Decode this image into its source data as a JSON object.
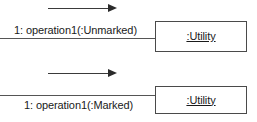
{
  "diagram": {
    "type": "uml-communication-diagram",
    "background_color": "#ffffff",
    "line_color": "#555555",
    "arrow_color": "#2b2b2b",
    "border_color": "#4a4a4a",
    "text_color": "#1a1a1a",
    "groups": [
      {
        "id": "unmarked",
        "message_label": "1: operation1(:Unmarked)",
        "object_label": ":Utility",
        "arrow_direction": "right",
        "arrow_caption": ""
      },
      {
        "id": "marked",
        "message_label": "1: operation1(:Marked)",
        "object_label": ":Utility",
        "arrow_direction": "right",
        "arrow_caption": ""
      }
    ]
  }
}
